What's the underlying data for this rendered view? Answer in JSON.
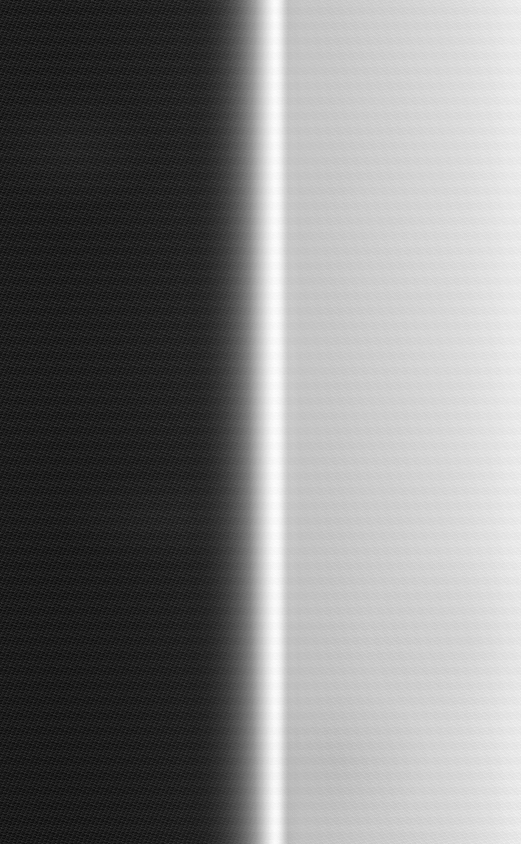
{
  "image": {
    "title": "Grayscale vertical edge gradient",
    "width_px": 521,
    "height_px": 844,
    "colorspace": "grayscale",
    "description": "A near-black field on the left transitions through a steep ramp into a narrow blown-out white vertical band, then drops to a light gray plateau that slowly brightens toward the right edge. Visible film-grain noise throughout, strongest in the dark region."
  },
  "regions": [
    {
      "name": "dark-field",
      "label": "Dark field",
      "x_start": 0,
      "x_end": 200,
      "gray_value": 14,
      "hex": "#0e0e0e",
      "noise": "high"
    },
    {
      "name": "rising-edge",
      "label": "Rising edge",
      "x_start": 200,
      "x_end": 268,
      "gray_start": 20,
      "gray_end": 230,
      "noise": "medium"
    },
    {
      "name": "specular-band",
      "label": "Specular highlight band",
      "x_start": 268,
      "x_end": 282,
      "peak_x": 276,
      "gray_value": 255,
      "hex": "#ffffff",
      "noise": "low"
    },
    {
      "name": "falling-edge",
      "label": "Falling edge",
      "x_start": 282,
      "x_end": 290,
      "gray_start": 246,
      "gray_end": 188,
      "noise": "low"
    },
    {
      "name": "light-plateau",
      "label": "Light gray plateau",
      "x_start": 290,
      "x_end": 521,
      "gray_start": 196,
      "gray_end": 242,
      "hex_start": "#c4c4c4",
      "hex_end": "#f2f2f2",
      "noise": "low"
    }
  ],
  "chart_data": {
    "type": "line",
    "title": "Horizontal luminance profile",
    "xlabel": "x position (px)",
    "ylabel": "luminance (0-255)",
    "xlim": [
      0,
      521
    ],
    "ylim": [
      0,
      255
    ],
    "grid": false,
    "legend": "none",
    "x": [
      0,
      30,
      60,
      90,
      120,
      150,
      170,
      185,
      195,
      205,
      215,
      225,
      235,
      245,
      252,
      258,
      263,
      267,
      271,
      274,
      276,
      279,
      282,
      285,
      288,
      292,
      300,
      320,
      345,
      370,
      395,
      420,
      445,
      470,
      495,
      521
    ],
    "series": [
      {
        "name": "luminance",
        "values": [
          14,
          13,
          14,
          15,
          16,
          18,
          19,
          21,
          23,
          30,
          42,
          60,
          86,
          118,
          142,
          168,
          196,
          220,
          242,
          253,
          255,
          246,
          226,
          203,
          188,
          196,
          200,
          202,
          205,
          209,
          213,
          217,
          221,
          226,
          234,
          242
        ]
      }
    ],
    "annotations": [
      {
        "x": 276,
        "y": 255,
        "text": "peak (clipped white)"
      },
      {
        "x": 100,
        "y": 14,
        "text": "black level"
      },
      {
        "x": 288,
        "y": 188,
        "text": "shoulder minimum"
      }
    ]
  }
}
